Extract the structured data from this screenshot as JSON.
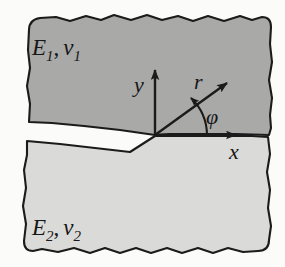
{
  "figure": {
    "name": "bimaterial-interface-crack",
    "background_color": "#fbfbfa",
    "ink_color": "#1b1b1b"
  },
  "regions": {
    "upper": {
      "name": "upper-material",
      "label_E": "E",
      "label_E_sub": "1",
      "separator": ",",
      "label_nu": "ν",
      "label_nu_sub": "1",
      "fill_color": "#a9a9a8",
      "label_x": 32,
      "label_y": 55
    },
    "lower": {
      "name": "lower-material",
      "label_E": "E",
      "label_E_sub": "2",
      "separator": ",",
      "label_nu": "ν",
      "label_nu_sub": "2",
      "fill_color": "#dadad8",
      "label_x": 32,
      "label_y": 235
    }
  },
  "axes": {
    "origin": {
      "x": 155,
      "y": 135
    },
    "y_axis": {
      "label": "y",
      "label_x": 134,
      "label_y": 92,
      "tip_x": 155,
      "tip_y": 64
    },
    "x_axis": {
      "label": "x",
      "label_x": 229,
      "label_y": 158,
      "tip_x": 243,
      "tip_y": 135
    },
    "r_ray": {
      "label": "r",
      "label_x": 196,
      "label_y": 88,
      "tip_x": 234,
      "tip_y": 77
    },
    "angle": {
      "label": "φ",
      "label_x": 207,
      "label_y": 122,
      "radius": 52,
      "degrees": 52
    }
  }
}
